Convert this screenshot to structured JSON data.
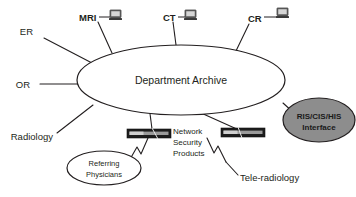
{
  "diagram": {
    "type": "network-topology",
    "title_node": "Department Archive",
    "center": {
      "label": "Department Archive",
      "shape": "ellipse",
      "fill": "#ffffff",
      "stroke": "#231f20"
    },
    "modality_nodes": [
      {
        "id": "mri",
        "label": "MRI",
        "icon": "workstation-icon",
        "bold": true
      },
      {
        "id": "ct",
        "label": "CT",
        "icon": "workstation-icon",
        "bold": true
      },
      {
        "id": "cr",
        "label": "CR",
        "icon": "workstation-icon",
        "bold": true
      }
    ],
    "department_nodes": [
      {
        "id": "er",
        "label": "ER"
      },
      {
        "id": "or",
        "label": "OR"
      },
      {
        "id": "radiology",
        "label": "Radiology"
      }
    ],
    "ellipse_nodes": [
      {
        "id": "referring-physicians",
        "line1": "Referring",
        "line2": "Physicians",
        "fill": "#ffffff",
        "bold": false
      },
      {
        "id": "ris-cis-his",
        "line1": "RIS/CIS/HIS",
        "line2": "Interface",
        "fill": "#8d8d8d",
        "bold": true
      }
    ],
    "firewall_nodes": [
      {
        "id": "firewall-left",
        "icon": "firewall-icon"
      },
      {
        "id": "firewall-right",
        "icon": "firewall-icon"
      }
    ],
    "firewall_caption": {
      "line1": "Network",
      "line2": "Security",
      "line3": "Products"
    },
    "tele_radiology_label": "Tele-radiology",
    "colors": {
      "stroke": "#231f20",
      "gray_fill": "#8d8d8d",
      "firewall_dark": "#1c1c1c",
      "firewall_band": "#9a9a9a",
      "background": "#ffffff"
    }
  }
}
